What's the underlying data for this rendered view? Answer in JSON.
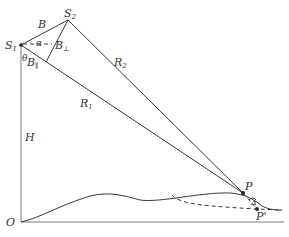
{
  "diagram": {
    "labels": {
      "s1": "S",
      "s1_sub": "1",
      "s2": "S",
      "s2_sub": "2",
      "baseline": "B",
      "alpha": "α",
      "b_perp": "B",
      "b_perp_sub": "⊥",
      "theta": "θ",
      "b_par": "B",
      "b_par_sub": "∥",
      "r1": "R",
      "r1_sub": "1",
      "r2": "R",
      "r2_sub": "2",
      "height": "H",
      "origin": "O",
      "p": "P",
      "p_prime": "P'",
      "delta": "Δ"
    }
  }
}
